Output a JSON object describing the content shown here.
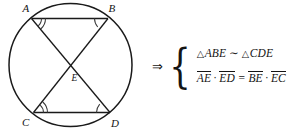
{
  "figure": {
    "diagram": {
      "circle": {
        "cx": 70.5,
        "cy": 65,
        "r": 61.5
      },
      "vertices": [
        {
          "id": "A",
          "label": "A",
          "x": 31.5,
          "y": 18.5,
          "label_x": 22.5,
          "label_y": 12.0,
          "arcs": 2
        },
        {
          "id": "B",
          "label": "B",
          "x": 108.0,
          "y": 18.5,
          "label_x": 108.5,
          "label_y": 12.0,
          "arcs": 1
        },
        {
          "id": "C",
          "label": "C",
          "x": 33.5,
          "y": 112.5,
          "label_x": 22.0,
          "label_y": 126.0,
          "arcs": 2
        },
        {
          "id": "D",
          "label": "D",
          "x": 110.0,
          "y": 112.5,
          "label_x": 111.0,
          "label_y": 126.5,
          "arcs": 1
        }
      ],
      "intersection": {
        "id": "E",
        "label": "E",
        "x": 70.5,
        "y": 73.0,
        "label_x": 71.5,
        "label_y": 81.0
      },
      "chords": [
        {
          "from": "A",
          "to": "B"
        },
        {
          "from": "C",
          "to": "D"
        },
        {
          "from": "A",
          "to": "D"
        },
        {
          "from": "B",
          "to": "C"
        }
      ],
      "stroke_color": "#1a1a1a",
      "arc_color": "#3a3a3a"
    },
    "conclusion": {
      "implies_symbol": "⇒",
      "brace_symbol": "{",
      "line1": {
        "triangle_symbol": "△",
        "triangle_1": "ABE",
        "similar_symbol": "∼",
        "triangle_2": "CDE"
      },
      "line2": {
        "seg_1": "AE",
        "dot_1": "·",
        "seg_2": "ED",
        "equals": "=",
        "seg_3": "BE",
        "dot_2": "·",
        "seg_4": "EC"
      }
    }
  }
}
